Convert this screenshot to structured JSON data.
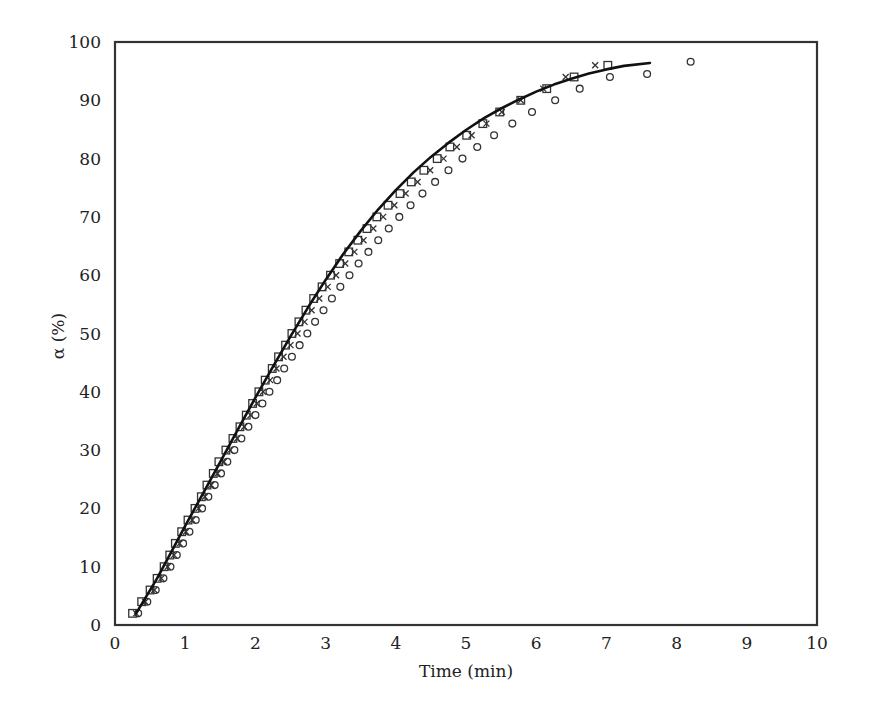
{
  "chart_data": {
    "type": "scatter",
    "title": "",
    "xlabel": "Time (min)",
    "ylabel": "α (%)",
    "xlim": [
      0,
      10
    ],
    "ylim": [
      0,
      100
    ],
    "x_ticks": [
      0,
      1,
      2,
      3,
      4,
      5,
      6,
      7,
      8,
      9,
      10
    ],
    "y_ticks": [
      0,
      10,
      20,
      30,
      40,
      50,
      60,
      70,
      80,
      90,
      100
    ],
    "grid": false,
    "legend": null,
    "series": [
      {
        "name": "series-square",
        "marker": "square",
        "points": [
          [
            0.25,
            2
          ],
          [
            0.38,
            4
          ],
          [
            0.5,
            6
          ],
          [
            0.6,
            8
          ],
          [
            0.7,
            10
          ],
          [
            0.78,
            12
          ],
          [
            0.86,
            14
          ],
          [
            0.95,
            16
          ],
          [
            1.04,
            18
          ],
          [
            1.14,
            20
          ],
          [
            1.23,
            22
          ],
          [
            1.31,
            24
          ],
          [
            1.4,
            26
          ],
          [
            1.48,
            28
          ],
          [
            1.58,
            30
          ],
          [
            1.68,
            32
          ],
          [
            1.78,
            34
          ],
          [
            1.87,
            36
          ],
          [
            1.96,
            38
          ],
          [
            2.05,
            40
          ],
          [
            2.14,
            42
          ],
          [
            2.24,
            44
          ],
          [
            2.33,
            46
          ],
          [
            2.43,
            48
          ],
          [
            2.52,
            50
          ],
          [
            2.62,
            52
          ],
          [
            2.72,
            54
          ],
          [
            2.83,
            56
          ],
          [
            2.95,
            58
          ],
          [
            3.07,
            60
          ],
          [
            3.2,
            62
          ],
          [
            3.33,
            64
          ],
          [
            3.46,
            66
          ],
          [
            3.59,
            68
          ],
          [
            3.73,
            70
          ],
          [
            3.89,
            72
          ],
          [
            4.06,
            74
          ],
          [
            4.22,
            76
          ],
          [
            4.4,
            78
          ],
          [
            4.59,
            80
          ],
          [
            4.77,
            82
          ],
          [
            5.01,
            84
          ],
          [
            5.24,
            86
          ],
          [
            5.48,
            88
          ],
          [
            5.78,
            90
          ],
          [
            6.15,
            92
          ],
          [
            6.54,
            94
          ],
          [
            7.02,
            96
          ]
        ]
      },
      {
        "name": "series-x",
        "marker": "x",
        "points": [
          [
            0.3,
            2
          ],
          [
            0.43,
            4
          ],
          [
            0.56,
            6
          ],
          [
            0.66,
            8
          ],
          [
            0.75,
            10
          ],
          [
            0.84,
            12
          ],
          [
            0.92,
            14
          ],
          [
            1.01,
            16
          ],
          [
            1.1,
            18
          ],
          [
            1.19,
            20
          ],
          [
            1.28,
            22
          ],
          [
            1.37,
            24
          ],
          [
            1.46,
            26
          ],
          [
            1.55,
            28
          ],
          [
            1.64,
            30
          ],
          [
            1.74,
            32
          ],
          [
            1.84,
            34
          ],
          [
            1.93,
            36
          ],
          [
            2.02,
            38
          ],
          [
            2.11,
            40
          ],
          [
            2.21,
            42
          ],
          [
            2.3,
            44
          ],
          [
            2.4,
            46
          ],
          [
            2.5,
            48
          ],
          [
            2.6,
            50
          ],
          [
            2.7,
            52
          ],
          [
            2.8,
            54
          ],
          [
            2.91,
            56
          ],
          [
            3.03,
            58
          ],
          [
            3.15,
            60
          ],
          [
            3.28,
            62
          ],
          [
            3.41,
            64
          ],
          [
            3.54,
            66
          ],
          [
            3.68,
            68
          ],
          [
            3.82,
            70
          ],
          [
            3.98,
            72
          ],
          [
            4.14,
            74
          ],
          [
            4.31,
            76
          ],
          [
            4.49,
            78
          ],
          [
            4.68,
            80
          ],
          [
            4.87,
            82
          ],
          [
            5.08,
            84
          ],
          [
            5.29,
            86
          ],
          [
            5.51,
            88
          ],
          [
            5.78,
            90
          ],
          [
            6.1,
            92
          ],
          [
            6.42,
            94
          ],
          [
            6.84,
            96
          ]
        ]
      },
      {
        "name": "series-circle",
        "marker": "circle",
        "points": [
          [
            0.33,
            2
          ],
          [
            0.46,
            4
          ],
          [
            0.58,
            6
          ],
          [
            0.69,
            8
          ],
          [
            0.79,
            10
          ],
          [
            0.88,
            12
          ],
          [
            0.97,
            14
          ],
          [
            1.06,
            16
          ],
          [
            1.15,
            18
          ],
          [
            1.24,
            20
          ],
          [
            1.33,
            22
          ],
          [
            1.42,
            24
          ],
          [
            1.51,
            26
          ],
          [
            1.6,
            28
          ],
          [
            1.7,
            30
          ],
          [
            1.8,
            32
          ],
          [
            1.9,
            34
          ],
          [
            2.0,
            36
          ],
          [
            2.1,
            38
          ],
          [
            2.2,
            40
          ],
          [
            2.31,
            42
          ],
          [
            2.41,
            44
          ],
          [
            2.52,
            46
          ],
          [
            2.63,
            48
          ],
          [
            2.74,
            50
          ],
          [
            2.85,
            52
          ],
          [
            2.97,
            54
          ],
          [
            3.09,
            56
          ],
          [
            3.21,
            58
          ],
          [
            3.34,
            60
          ],
          [
            3.47,
            62
          ],
          [
            3.61,
            64
          ],
          [
            3.75,
            66
          ],
          [
            3.9,
            68
          ],
          [
            4.05,
            70
          ],
          [
            4.21,
            72
          ],
          [
            4.38,
            74
          ],
          [
            4.56,
            76
          ],
          [
            4.75,
            78
          ],
          [
            4.95,
            80
          ],
          [
            5.16,
            82
          ],
          [
            5.4,
            84
          ],
          [
            5.66,
            86
          ],
          [
            5.94,
            88
          ],
          [
            6.27,
            90
          ],
          [
            6.62,
            92
          ],
          [
            7.05,
            94
          ],
          [
            7.58,
            94.5
          ],
          [
            8.2,
            96.6
          ]
        ]
      },
      {
        "name": "model-fit",
        "marker": "line",
        "points": [
          [
            0.3,
            2
          ],
          [
            0.45,
            5
          ],
          [
            0.6,
            8
          ],
          [
            0.8,
            12.5
          ],
          [
            1.0,
            17
          ],
          [
            1.25,
            22.5
          ],
          [
            1.5,
            28
          ],
          [
            1.75,
            33.5
          ],
          [
            2.0,
            39
          ],
          [
            2.25,
            44.3
          ],
          [
            2.5,
            49.5
          ],
          [
            2.75,
            54.5
          ],
          [
            3.0,
            59.2
          ],
          [
            3.25,
            63.6
          ],
          [
            3.5,
            67.6
          ],
          [
            3.75,
            71.3
          ],
          [
            4.0,
            74.6
          ],
          [
            4.25,
            77.6
          ],
          [
            4.5,
            80.3
          ],
          [
            4.75,
            82.7
          ],
          [
            5.0,
            84.9
          ],
          [
            5.25,
            86.9
          ],
          [
            5.5,
            88.6
          ],
          [
            5.75,
            90.1
          ],
          [
            6.0,
            91.5
          ],
          [
            6.25,
            92.7
          ],
          [
            6.5,
            93.7
          ],
          [
            6.75,
            94.6
          ],
          [
            7.0,
            95.3
          ],
          [
            7.25,
            95.9
          ],
          [
            7.62,
            96.4
          ]
        ]
      }
    ]
  }
}
